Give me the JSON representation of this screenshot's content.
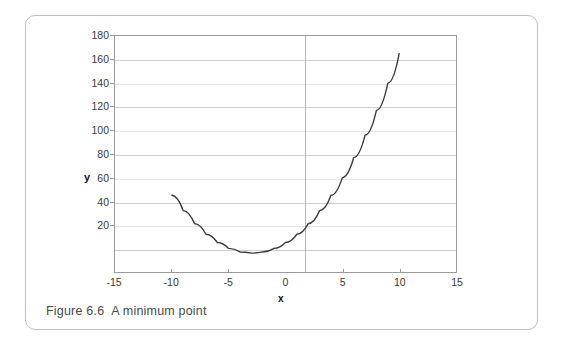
{
  "figure": {
    "caption_label": "Figure 6.6",
    "caption_text": "A minimum point"
  },
  "chart_data": {
    "type": "line",
    "title": "",
    "subtitle": "",
    "xlabel": "x",
    "ylabel": "y",
    "xlim": [
      -15,
      15
    ],
    "ylim": [
      -20,
      180
    ],
    "grid": true,
    "legend": "none",
    "xticks": [
      -15,
      -10,
      -5,
      0,
      5,
      10,
      15
    ],
    "xtick_labels": [
      "-15",
      "-10",
      "-5",
      "0",
      "5",
      "10",
      "15"
    ],
    "yticks": [
      20,
      40,
      60,
      80,
      100,
      120,
      140,
      160,
      180
    ],
    "ytick_labels": [
      "20",
      "40",
      "60",
      "80",
      "100",
      "120",
      "140",
      "160",
      "180"
    ],
    "series": [
      {
        "name": "parabola",
        "color": "#3c3c3c",
        "x": [
          -10,
          -9,
          -8,
          -7,
          -6,
          -5,
          -4,
          -3,
          -2,
          -1,
          0,
          1,
          2,
          3,
          4,
          5,
          6,
          7,
          8,
          9,
          10
        ],
        "values": [
          45,
          32,
          21,
          12,
          5,
          0,
          -3,
          -4,
          -3,
          0,
          5,
          12,
          21,
          32,
          45,
          60,
          77,
          96,
          117,
          140,
          165
        ]
      }
    ],
    "annotations": [
      {
        "name": "minimum-point",
        "x": -3,
        "y": -4,
        "label": "minimum point"
      }
    ]
  }
}
